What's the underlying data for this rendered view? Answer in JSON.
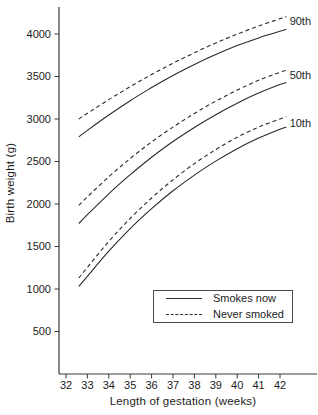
{
  "figure": {
    "background": "#ffffff",
    "ink": "#2a2a2a",
    "axis_color": "#3a3a3a",
    "text_color": "#1c1c1c"
  },
  "chart_data": {
    "type": "line",
    "title": "",
    "xlabel": "Length of gestation (weeks)",
    "ylabel": "Birth weight (g)",
    "x_ticks": [
      32,
      33,
      34,
      35,
      36,
      37,
      38,
      39,
      40,
      41,
      42
    ],
    "y_ticks": [
      500,
      1000,
      1500,
      2000,
      2500,
      3000,
      3500,
      4000
    ],
    "xlim": [
      31.65,
      43.75
    ],
    "ylim": [
      0,
      4320
    ],
    "grid": false,
    "x_weeks": [
      32.6,
      33,
      34,
      35,
      36,
      37,
      38,
      39,
      40,
      41,
      42,
      42.3
    ],
    "series": [
      {
        "name": "90th-never-smoked",
        "percentile": "90th",
        "group": "Never smoked",
        "style": "dashed",
        "values": [
          3000,
          3067,
          3228,
          3380,
          3523,
          3656,
          3780,
          3894,
          3999,
          4094,
          4180,
          4205
        ]
      },
      {
        "name": "90th-smokes-now",
        "percentile": "90th",
        "group": "Smokes now",
        "style": "solid",
        "values": [
          2790,
          2866,
          3047,
          3215,
          3370,
          3513,
          3642,
          3759,
          3863,
          3954,
          4032,
          4055
        ]
      },
      {
        "name": "50th-never-smoked",
        "percentile": "50th",
        "group": "Never smoked",
        "style": "dashed",
        "values": [
          1985,
          2085,
          2320,
          2535,
          2730,
          2905,
          3065,
          3210,
          3340,
          3455,
          3550,
          3575
        ]
      },
      {
        "name": "50th-smokes-now",
        "percentile": "50th",
        "group": "Smokes now",
        "style": "solid",
        "values": [
          1770,
          1875,
          2120,
          2345,
          2550,
          2735,
          2900,
          3050,
          3185,
          3305,
          3405,
          3428
        ]
      },
      {
        "name": "10th-never-smoked",
        "percentile": "10th",
        "group": "Never smoked",
        "style": "dashed",
        "values": [
          1130,
          1255,
          1560,
          1830,
          2070,
          2285,
          2475,
          2640,
          2785,
          2905,
          3000,
          3025
        ]
      },
      {
        "name": "10th-smokes-now",
        "percentile": "10th",
        "group": "Smokes now",
        "style": "solid",
        "values": [
          1030,
          1150,
          1445,
          1710,
          1945,
          2155,
          2340,
          2505,
          2650,
          2775,
          2880,
          2905
        ]
      }
    ],
    "curve_labels": [
      {
        "text": "90th",
        "week": 42.45,
        "gram": 4150
      },
      {
        "text": "50th",
        "week": 42.45,
        "gram": 3520
      },
      {
        "text": "10th",
        "week": 42.45,
        "gram": 2950
      }
    ],
    "legend": {
      "position": "inside-bottom-right",
      "entries": [
        {
          "label": "Smokes now",
          "style": "solid"
        },
        {
          "label": "Never smoked",
          "style": "dashed"
        }
      ]
    }
  }
}
